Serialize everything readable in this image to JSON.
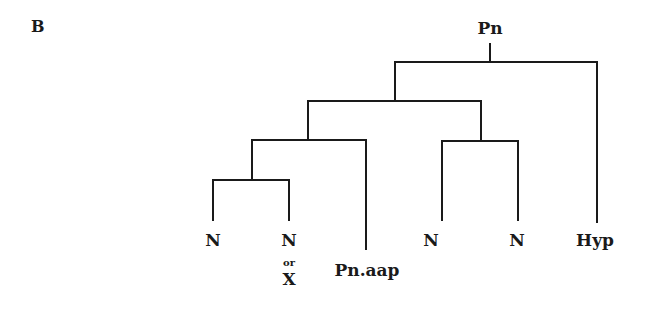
{
  "panel": {
    "label": "B"
  },
  "tree": {
    "root": "Pn",
    "edges_description": "Pn -> (((N, N or X), Pn.aap), (N, N)), Hyp",
    "leaves": [
      {
        "id": "leaf1",
        "label": "N"
      },
      {
        "id": "leaf2",
        "label": "N",
        "sub": "or",
        "alt": "X"
      },
      {
        "id": "leaf3",
        "label": "Pn.aap"
      },
      {
        "id": "leaf4",
        "label": "N"
      },
      {
        "id": "leaf5",
        "label": "N"
      },
      {
        "id": "leaf6",
        "label": "Hyp"
      }
    ],
    "line_color": "#1a1a1a"
  }
}
